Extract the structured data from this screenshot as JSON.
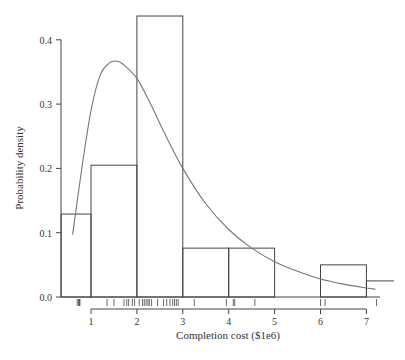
{
  "chart_data": {
    "type": "histogram",
    "title": "",
    "xlabel": "Completion cost ($1e6)",
    "ylabel": "Probability density",
    "x_ticks": [
      "1",
      "2",
      "3",
      "4",
      "5",
      "6",
      "7"
    ],
    "y_ticks": [
      "0.0",
      "0.1",
      "0.2",
      "0.3",
      "0.4"
    ],
    "xlim": [
      0.35,
      7.6
    ],
    "ylim": [
      0,
      0.44
    ],
    "grid": false,
    "legend": null,
    "bins": [
      {
        "x0": 0.35,
        "x1": 1,
        "density": 0.129
      },
      {
        "x0": 1,
        "x1": 2,
        "density": 0.205
      },
      {
        "x0": 2,
        "x1": 3,
        "density": 0.437
      },
      {
        "x0": 3,
        "x1": 4,
        "density": 0.076
      },
      {
        "x0": 4,
        "x1": 5,
        "density": 0.076
      },
      {
        "x0": 5,
        "x1": 6,
        "density": 0.0
      },
      {
        "x0": 6,
        "x1": 7,
        "density": 0.05
      },
      {
        "x0": 7,
        "x1": 7.6,
        "density": 0.025
      }
    ],
    "density_curve": {
      "description": "fitted right-skewed (lognormal-like) density",
      "x": [
        0.6,
        0.8,
        1.0,
        1.2,
        1.4,
        1.55,
        1.7,
        2.0,
        2.3,
        2.6,
        3.0,
        3.5,
        4.0,
        4.5,
        5.0,
        5.5,
        6.0,
        6.5,
        7.0,
        7.2
      ],
      "y": [
        0.097,
        0.2,
        0.29,
        0.345,
        0.364,
        0.367,
        0.362,
        0.34,
        0.3,
        0.255,
        0.2,
        0.145,
        0.105,
        0.076,
        0.055,
        0.04,
        0.028,
        0.02,
        0.014,
        0.012
      ]
    },
    "rug": [
      0.7,
      0.73,
      0.75,
      0.76,
      1.35,
      1.5,
      1.72,
      1.78,
      1.82,
      1.9,
      1.95,
      2.05,
      2.12,
      2.16,
      2.2,
      2.24,
      2.27,
      2.32,
      2.45,
      2.58,
      2.65,
      2.72,
      2.78,
      2.82,
      2.86,
      2.9,
      3.25,
      3.95,
      4.1,
      4.13,
      4.57,
      6.0,
      6.1,
      7.22
    ]
  }
}
